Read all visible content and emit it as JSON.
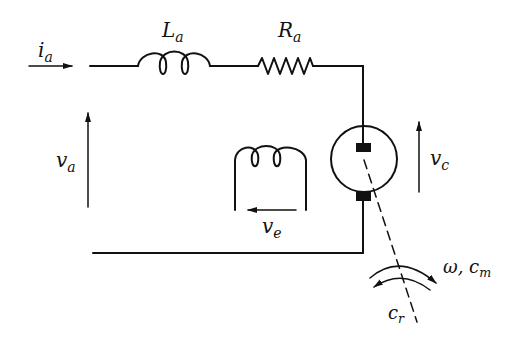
{
  "diagram": {
    "colors": {
      "stroke": "#111111",
      "background": "#ffffff"
    },
    "labels": {
      "ia": {
        "base": "i",
        "sub": "a"
      },
      "La": {
        "base": "L",
        "sub": "a"
      },
      "Ra": {
        "base": "R",
        "sub": "a"
      },
      "va": {
        "base": "v",
        "sub": "a"
      },
      "vc": {
        "base": "v",
        "sub": "c"
      },
      "ve": {
        "base": "v",
        "sub": "e"
      },
      "omega_cm": {
        "base": "ω,  c",
        "sub": "m"
      },
      "cr": {
        "base": "c",
        "sub": "r"
      }
    },
    "components": [
      {
        "id": "armature-inductor",
        "symbol": "inductor",
        "label": "La"
      },
      {
        "id": "armature-resistor",
        "symbol": "resistor",
        "label": "Ra"
      },
      {
        "id": "motor",
        "symbol": "dc-machine",
        "label": "vc"
      },
      {
        "id": "field-winding",
        "symbol": "inductor",
        "label": "ve"
      }
    ]
  }
}
